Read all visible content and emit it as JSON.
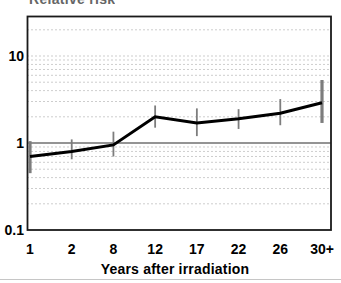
{
  "chart_data": {
    "type": "line",
    "title": "Relative risk",
    "xlabel": "Years after irradiation",
    "ylabel": "Relative risk",
    "y_scale": "log",
    "ylim": [
      0.1,
      28
    ],
    "categories": [
      "1",
      "2",
      "8",
      "12",
      "17",
      "22",
      "26",
      "30+"
    ],
    "y_ticks": [
      {
        "label": "10",
        "value": 10
      },
      {
        "label": "1",
        "value": 1
      },
      {
        "label": "0.1",
        "value": 0.1
      }
    ],
    "gridlines": [
      0.2,
      0.3,
      0.4,
      0.5,
      0.6,
      0.7,
      0.8,
      0.9,
      2,
      3,
      4,
      5,
      6,
      7,
      8,
      9,
      10,
      20
    ],
    "grid_style": "dotted horizontal minor log gridlines",
    "reference_line": 1,
    "legend": "none",
    "series": [
      {
        "name": "relative-risk",
        "values": [
          0.7,
          0.8,
          0.95,
          2.0,
          1.7,
          1.9,
          2.2,
          2.9
        ],
        "ci_low": [
          0.45,
          0.65,
          0.7,
          1.5,
          1.2,
          1.45,
          1.6,
          1.7
        ],
        "ci_high": [
          1.05,
          1.1,
          1.35,
          2.7,
          2.5,
          2.45,
          3.2,
          5.3
        ]
      }
    ]
  },
  "colors": {
    "line": "#000000",
    "error_bar": "#7d7d7d",
    "grid_dots": "#9b9b9b",
    "reference_line": "#2b2b2b",
    "axis": "#1a1a1a",
    "background": "#ffffff",
    "title_text": "#666666"
  }
}
